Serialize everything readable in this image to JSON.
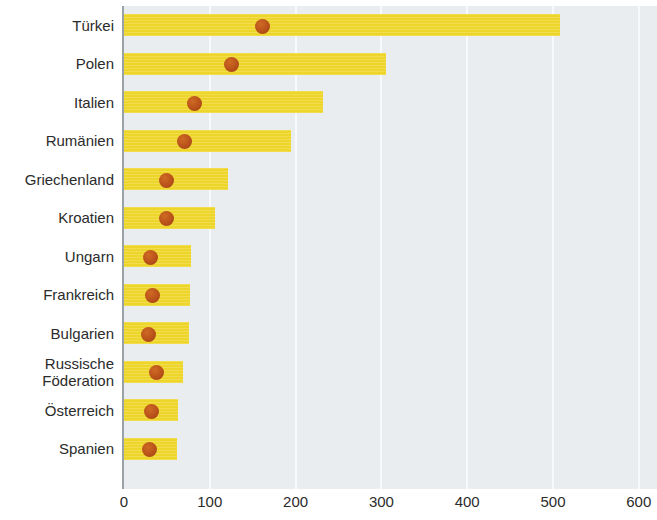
{
  "chart_data": {
    "type": "bar",
    "title": "",
    "subtitle": "",
    "xlabel": "",
    "ylabel": "",
    "orientation": "horizontal",
    "xlim": [
      0,
      600
    ],
    "xticks": [
      0,
      100,
      200,
      300,
      400,
      500,
      600
    ],
    "xtick_labels": [
      "0",
      "100",
      "200",
      "300",
      "400",
      "500",
      "600"
    ],
    "grid": "vertical gridlines at each x tick",
    "legend": "none",
    "categories": [
      "Türkei",
      "Polen",
      "Italien",
      "Rumänien",
      "Griechenland",
      "Kroatien",
      "Ungarn",
      "Frankreich",
      "Bulgarien",
      "Russische\nFöderation",
      "Österreich",
      "Spanien"
    ],
    "series": [
      {
        "name": "bar",
        "render": "bar",
        "values": [
          508,
          305,
          232,
          195,
          121,
          106,
          78,
          77,
          76,
          69,
          63,
          62
        ]
      },
      {
        "name": "marker",
        "render": "dot",
        "values": [
          161,
          125,
          82,
          70,
          49,
          50,
          31,
          33,
          28,
          38,
          32,
          30
        ]
      }
    ],
    "colors": {
      "bar": "#eed52a",
      "dot": "#b9511a",
      "plot_background": "#e9edef",
      "gridline": "#f7f9fa",
      "axis": "#9aa2a6",
      "text": "#2b2b2b"
    }
  }
}
